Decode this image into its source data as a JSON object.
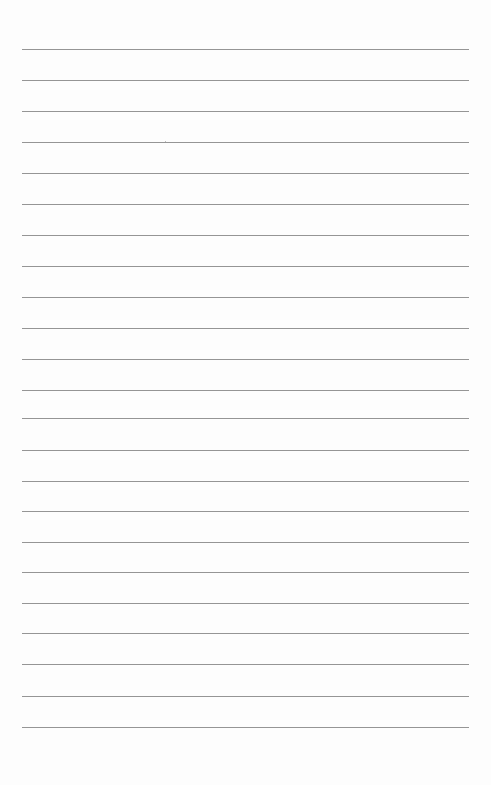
{
  "page": {
    "type": "lined-paper",
    "background_color": "#fdfdfd",
    "rule_color": "#8a8a8a",
    "rule_count": 23,
    "rule_left": 22,
    "rule_width": 447,
    "rule_positions": [
      49,
      80,
      111,
      142,
      173,
      204,
      235,
      266,
      297,
      328,
      359,
      390,
      418,
      450,
      481,
      511,
      542,
      572,
      603,
      633,
      664,
      696,
      727
    ]
  }
}
